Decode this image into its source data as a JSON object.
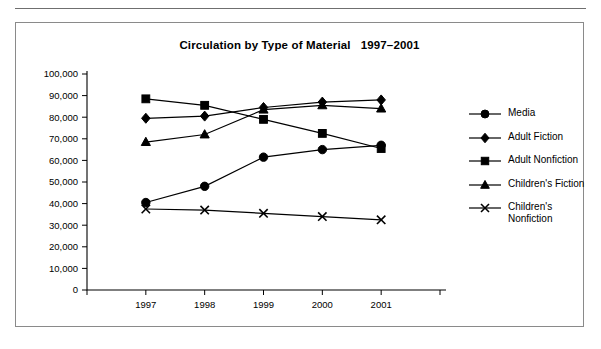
{
  "figure": {
    "title": "Circulation by Type of Material   1997–2001",
    "background": "#ffffff",
    "ink_color": "#000000",
    "border_color": "#8a8a8a"
  },
  "chart_data": {
    "type": "line",
    "title": "Circulation by Type of Material   1997–2001",
    "xlabel": "",
    "ylabel": "",
    "categories": [
      "1997",
      "1998",
      "1999",
      "2000",
      "2001"
    ],
    "x_tick_labels": [
      "1997",
      "1998",
      "1999",
      "2000",
      "2001"
    ],
    "y_tick_labels": [
      "0",
      "10,000",
      "20,000",
      "30,000",
      "40,000",
      "50,000",
      "60,000",
      "70,000",
      "80,000",
      "90,000",
      "100,000"
    ],
    "y_ticks": [
      0,
      10000,
      20000,
      30000,
      40000,
      50000,
      60000,
      70000,
      80000,
      90000,
      100000
    ],
    "ylim": [
      0,
      100000
    ],
    "grid": false,
    "legend_position": "right",
    "series": [
      {
        "name": "Media",
        "marker": "circle",
        "values": [
          40500,
          48000,
          61500,
          65000,
          67000
        ]
      },
      {
        "name": "Adult Fiction",
        "marker": "diamond",
        "values": [
          79500,
          80500,
          84500,
          87000,
          88000
        ]
      },
      {
        "name": "Adult Nonfiction",
        "marker": "square",
        "values": [
          88500,
          85500,
          79000,
          72500,
          65500
        ]
      },
      {
        "name": "Children's Fiction",
        "marker": "triangle",
        "values": [
          68500,
          72000,
          83500,
          85500,
          84000
        ]
      },
      {
        "name": "Children's\nNonfiction",
        "marker": "x",
        "values": [
          37500,
          37000,
          35500,
          34000,
          32500
        ]
      }
    ]
  },
  "legend": {
    "items": [
      {
        "label": "Media",
        "marker": "circle"
      },
      {
        "label": "Adult Fiction",
        "marker": "diamond"
      },
      {
        "label": "Adult Nonfiction",
        "marker": "square"
      },
      {
        "label": "Children's Fiction",
        "marker": "triangle"
      },
      {
        "label": "Children's\nNonfiction",
        "marker": "x"
      }
    ]
  }
}
